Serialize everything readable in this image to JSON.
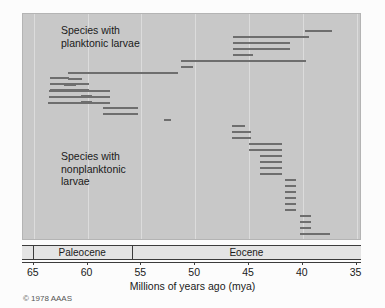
{
  "figure": {
    "copyright": "© 1978 AAAS",
    "axis_title": "Millions of years ago (mya)",
    "background_color": "#c8c8c8",
    "bar_color": "#6e6e6e",
    "gridline_color": "#dcdcdc"
  },
  "labels": {
    "planktonic": "Species with\nplanktonic larvae",
    "nonplanktonic": "Species with\nnonplanktonic\nlarvae"
  },
  "epochs": [
    {
      "name": "Paleocene",
      "start": 65.0,
      "end": 55.8
    },
    {
      "name": "Eocene",
      "start": 55.8,
      "end": 34.5
    }
  ],
  "chart_data": {
    "type": "bar",
    "xlabel": "Millions of years ago (mya)",
    "ylabel": "",
    "orientation": "horizontal-ranges",
    "xlim": [
      66.0,
      34.5
    ],
    "x_reversed": true,
    "ticks": [
      65,
      60,
      55,
      50,
      45,
      40,
      35
    ],
    "tick_labels": [
      "65",
      "60",
      "55",
      "50",
      "45",
      "40",
      "35"
    ],
    "grid": "vertical",
    "legend": "none",
    "units": "mya",
    "series": [
      {
        "name": "Species with planktonic larvae",
        "note": "Each horizontal bar is one species' stratigraphic duration (start = older, end = younger).",
        "ranges": [
          {
            "start": 39.8,
            "end": 37.3,
            "row": 0
          },
          {
            "start": 46.5,
            "end": 39.4,
            "row": 1
          },
          {
            "start": 46.5,
            "end": 41.2,
            "row": 2
          },
          {
            "start": 46.5,
            "end": 41.2,
            "row": 3
          },
          {
            "start": 46.5,
            "end": 44.6,
            "row": 4
          },
          {
            "start": 51.3,
            "end": 39.7,
            "row": 5
          },
          {
            "start": 51.3,
            "end": 50.2,
            "row": 6
          },
          {
            "start": 61.8,
            "end": 51.6,
            "row": 7
          },
          {
            "start": 61.8,
            "end": 60.5,
            "row": 8
          },
          {
            "start": 62.2,
            "end": 61.1,
            "row": 9
          },
          {
            "start": 63.6,
            "end": 57.9,
            "row": 10
          },
          {
            "start": 63.6,
            "end": 57.9,
            "row": 11
          },
          {
            "start": 63.7,
            "end": 57.9,
            "row": 12
          }
        ]
      },
      {
        "name": "Species with nonplanktonic larvae",
        "note": "Each horizontal bar is one species' stratigraphic duration (start = older, end = younger).",
        "ranges": [
          {
            "start": 40.3,
            "end": 37.5,
            "row": 0
          },
          {
            "start": 40.3,
            "end": 39.2,
            "row": 1
          },
          {
            "start": 40.3,
            "end": 39.2,
            "row": 2
          },
          {
            "start": 40.3,
            "end": 39.2,
            "row": 3
          },
          {
            "start": 41.7,
            "end": 40.6,
            "row": 4
          },
          {
            "start": 41.7,
            "end": 40.6,
            "row": 5
          },
          {
            "start": 41.7,
            "end": 40.6,
            "row": 6
          },
          {
            "start": 41.7,
            "end": 40.6,
            "row": 7
          },
          {
            "start": 41.7,
            "end": 40.6,
            "row": 8
          },
          {
            "start": 41.7,
            "end": 40.6,
            "row": 9
          },
          {
            "start": 44.0,
            "end": 41.9,
            "row": 10
          },
          {
            "start": 44.0,
            "end": 41.9,
            "row": 11
          },
          {
            "start": 44.0,
            "end": 41.9,
            "row": 12
          },
          {
            "start": 44.0,
            "end": 41.9,
            "row": 13
          },
          {
            "start": 45.0,
            "end": 41.9,
            "row": 14
          },
          {
            "start": 45.0,
            "end": 41.9,
            "row": 15
          },
          {
            "start": 46.6,
            "end": 44.8,
            "row": 16
          },
          {
            "start": 46.6,
            "end": 44.8,
            "row": 17
          },
          {
            "start": 46.6,
            "end": 45.4,
            "row": 18
          },
          {
            "start": 52.9,
            "end": 52.2,
            "row": 19
          },
          {
            "start": 58.6,
            "end": 55.3,
            "row": 20
          },
          {
            "start": 58.6,
            "end": 55.3,
            "row": 21
          },
          {
            "start": 60.6,
            "end": 59.6,
            "row": 22
          },
          {
            "start": 60.6,
            "end": 59.6,
            "row": 23
          },
          {
            "start": 63.5,
            "end": 59.9,
            "row": 24
          },
          {
            "start": 63.5,
            "end": 59.9,
            "row": 25
          },
          {
            "start": 63.5,
            "end": 61.7,
            "row": 26
          }
        ]
      }
    ]
  }
}
